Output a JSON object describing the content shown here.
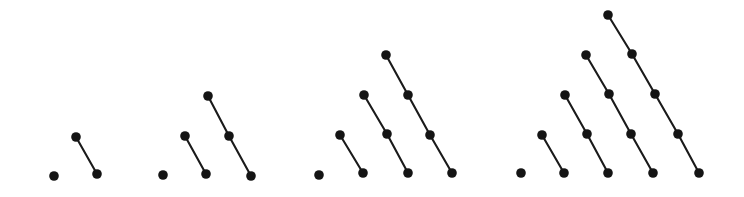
{
  "figure": {
    "background_color": "#ffffff",
    "node_color": "#141414",
    "edge_color": "#1a1a1a",
    "node_radius": 4.8,
    "edge_width": 2.1,
    "canvas": {
      "width": 744,
      "height": 197
    }
  },
  "chart_data": {
    "type": "scatter",
    "title": "",
    "subtitle": "",
    "xlabel": "",
    "ylabel": "",
    "xlim": [
      0,
      744
    ],
    "ylim": [
      197,
      0
    ],
    "grid": false,
    "legend": "none",
    "annotations": [],
    "groups": [
      {
        "name": "group-1",
        "chain_count": 2,
        "chains": [
          {
            "name": "chain-len-1",
            "length": 1,
            "points": [
              [
                54,
                176
              ]
            ]
          },
          {
            "name": "chain-len-2",
            "length": 2,
            "points": [
              [
                76,
                137
              ],
              [
                97,
                174
              ]
            ]
          }
        ]
      },
      {
        "name": "group-2",
        "chain_count": 3,
        "chains": [
          {
            "name": "chain-len-1",
            "length": 1,
            "points": [
              [
                163,
                175
              ]
            ]
          },
          {
            "name": "chain-len-2",
            "length": 2,
            "points": [
              [
                185,
                136
              ],
              [
                206,
                174
              ]
            ]
          },
          {
            "name": "chain-len-3",
            "length": 3,
            "points": [
              [
                208,
                96
              ],
              [
                229,
                136
              ],
              [
                251,
                176
              ]
            ]
          }
        ]
      },
      {
        "name": "group-3",
        "chain_count": 4,
        "chains": [
          {
            "name": "chain-len-1",
            "length": 1,
            "points": [
              [
                319,
                175
              ]
            ]
          },
          {
            "name": "chain-len-2",
            "length": 2,
            "points": [
              [
                340,
                135
              ],
              [
                363,
                173
              ]
            ]
          },
          {
            "name": "chain-len-3",
            "length": 3,
            "points": [
              [
                364,
                95
              ],
              [
                387,
                134
              ],
              [
                408,
                173
              ]
            ]
          },
          {
            "name": "chain-len-4",
            "length": 4,
            "points": [
              [
                386,
                55
              ],
              [
                408,
                95
              ],
              [
                430,
                135
              ],
              [
                452,
                173
              ]
            ]
          }
        ]
      },
      {
        "name": "group-4",
        "chain_count": 5,
        "chains": [
          {
            "name": "chain-len-1",
            "length": 1,
            "points": [
              [
                521,
                173
              ]
            ]
          },
          {
            "name": "chain-len-2",
            "length": 2,
            "points": [
              [
                542,
                135
              ],
              [
                564,
                173
              ]
            ]
          },
          {
            "name": "chain-len-3",
            "length": 3,
            "points": [
              [
                565,
                95
              ],
              [
                587,
                134
              ],
              [
                608,
                173
              ]
            ]
          },
          {
            "name": "chain-len-4",
            "length": 4,
            "points": [
              [
                586,
                55
              ],
              [
                609,
                94
              ],
              [
                631,
                134
              ],
              [
                653,
                173
              ]
            ]
          },
          {
            "name": "chain-len-5",
            "length": 5,
            "points": [
              [
                608,
                15
              ],
              [
                632,
                54
              ],
              [
                655,
                94
              ],
              [
                678,
                134
              ],
              [
                699,
                173
              ]
            ]
          }
        ]
      }
    ]
  }
}
